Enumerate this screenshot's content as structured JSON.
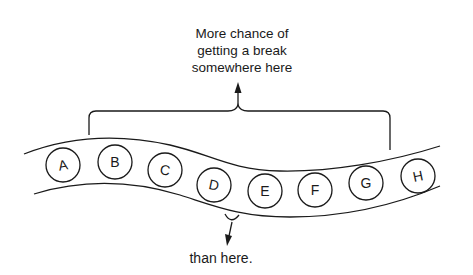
{
  "diagram": {
    "top_label": {
      "lines": [
        "More chance of",
        "getting a break",
        "somewhere here"
      ]
    },
    "bottom_label": "than here.",
    "genes": [
      {
        "label": "A",
        "cx": 63,
        "cy": 165,
        "rot": -10
      },
      {
        "label": "B",
        "cx": 115,
        "cy": 162,
        "rot": 0
      },
      {
        "label": "C",
        "cx": 165,
        "cy": 170,
        "rot": 10
      },
      {
        "label": "D",
        "cx": 214,
        "cy": 185,
        "rot": 12
      },
      {
        "label": "E",
        "cx": 265,
        "cy": 191,
        "rot": 0
      },
      {
        "label": "F",
        "cx": 315,
        "cy": 190,
        "rot": 0
      },
      {
        "label": "G",
        "cx": 366,
        "cy": 183,
        "rot": -3
      },
      {
        "label": "H",
        "cx": 418,
        "cy": 176,
        "rot": -12
      }
    ],
    "colors": {
      "ink": "#1a1a1a",
      "background": "#ffffff"
    }
  }
}
